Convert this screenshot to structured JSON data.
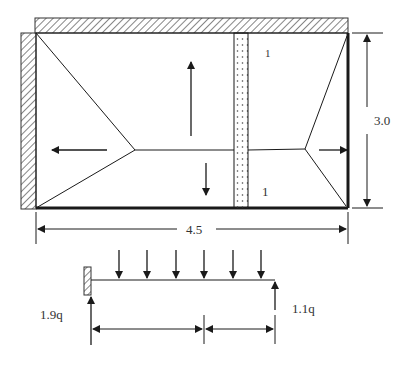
{
  "figure": {
    "type": "slab load distribution diagram",
    "colors": {
      "line": "#1a1a1a",
      "text": "#333333",
      "background": "#ffffff",
      "hatch": "#333333"
    }
  },
  "plan": {
    "dimensions": {
      "width_label": "4.5",
      "height_label": "3.0"
    },
    "panel_labels": [
      {
        "text": "1"
      },
      {
        "text": "1"
      }
    ],
    "supports": [
      "top-wall-hatched",
      "left-wall-hatched"
    ],
    "strip": "dotted-strip",
    "load_arrows": [
      "left",
      "up",
      "down",
      "right"
    ]
  },
  "beam": {
    "reactions": {
      "left": "1.9q",
      "right": "1.1q"
    },
    "distributed_load_arrow_count": 6,
    "support_left": "fixed-wall-hatched"
  }
}
